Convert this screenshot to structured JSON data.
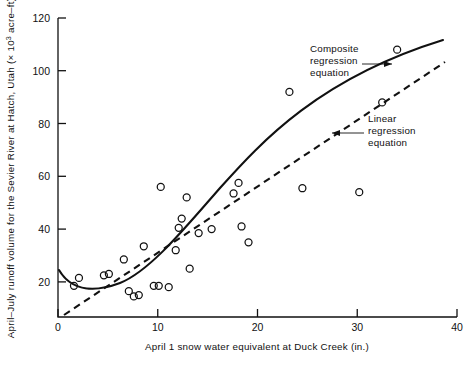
{
  "chart_data": {
    "type": "scatter",
    "title": "",
    "xlabel": "April 1 snow water equivalent at Duck Creek (in.)",
    "ylabel": "April-July runoff volume for the Sevier River at Hatch, Utah (× 10³ acre-ft)",
    "ylabel_parts": {
      "pre": "April–July runoff volume for the Sevier River at Hatch, Utah (× 10",
      "sup": "3",
      "post": " acre–ft)"
    },
    "xlim": [
      0,
      40
    ],
    "ylim": [
      6.7,
      120
    ],
    "xticks": [
      0,
      10,
      20,
      30,
      40
    ],
    "xticklabels": [
      "0",
      "10",
      "20",
      "30",
      "40"
    ],
    "yticks": [
      20,
      40,
      60,
      80,
      100,
      120
    ],
    "yticklabels": [
      "20",
      "40",
      "60",
      "80",
      "100",
      "120"
    ],
    "grid": false,
    "legend": "none",
    "marker": "open-circle",
    "points": [
      {
        "x": 1.6,
        "y": 18.5
      },
      {
        "x": 2.1,
        "y": 21.5
      },
      {
        "x": 4.6,
        "y": 22.5
      },
      {
        "x": 5.1,
        "y": 23.0
      },
      {
        "x": 6.6,
        "y": 28.5
      },
      {
        "x": 7.1,
        "y": 16.5
      },
      {
        "x": 7.6,
        "y": 14.5
      },
      {
        "x": 8.1,
        "y": 15.0
      },
      {
        "x": 8.6,
        "y": 33.5
      },
      {
        "x": 9.6,
        "y": 18.5
      },
      {
        "x": 10.1,
        "y": 18.5
      },
      {
        "x": 10.3,
        "y": 56.0
      },
      {
        "x": 11.1,
        "y": 18.0
      },
      {
        "x": 11.8,
        "y": 32.0
      },
      {
        "x": 12.1,
        "y": 40.5
      },
      {
        "x": 12.4,
        "y": 44.0
      },
      {
        "x": 12.9,
        "y": 52.0
      },
      {
        "x": 13.2,
        "y": 25.0
      },
      {
        "x": 14.1,
        "y": 38.5
      },
      {
        "x": 15.4,
        "y": 40.0
      },
      {
        "x": 17.6,
        "y": 53.5
      },
      {
        "x": 18.1,
        "y": 57.5
      },
      {
        "x": 18.4,
        "y": 41.0
      },
      {
        "x": 19.1,
        "y": 35.0
      },
      {
        "x": 23.2,
        "y": 92.0
      },
      {
        "x": 24.5,
        "y": 55.5
      },
      {
        "x": 30.2,
        "y": 54.0
      },
      {
        "x": 32.5,
        "y": 88.0
      },
      {
        "x": 34.0,
        "y": 108.0
      }
    ],
    "series": [
      {
        "name": "Composite regression equation",
        "style": "solid",
        "annotation": {
          "lines": [
            "Composite",
            "regression",
            "equation"
          ],
          "arrow": "right"
        }
      },
      {
        "name": "Linear regression equation",
        "style": "dashed",
        "annotation": {
          "lines": [
            "Linear",
            "regression",
            "equation"
          ],
          "arrow": "left"
        }
      }
    ]
  },
  "annotations": {
    "composite": {
      "line1": "Composite",
      "line2": "regression",
      "line3": "equation"
    },
    "linear": {
      "line1": "Linear",
      "line2": "regression",
      "line3": "equation"
    }
  },
  "axes": {
    "x_title": "April 1 snow water equivalent at Duck Creek (in.)",
    "y_title_pre": "April–July runoff volume for the Sevier River at Hatch, Utah (× 10",
    "y_title_sup": "3",
    "y_title_post": " acre–ft)",
    "xtick_0": "0",
    "xtick_1": "10",
    "xtick_2": "20",
    "xtick_3": "30",
    "xtick_4": "40",
    "ytick_0": "20",
    "ytick_1": "40",
    "ytick_2": "60",
    "ytick_3": "80",
    "ytick_4": "100",
    "ytick_5": "120"
  }
}
